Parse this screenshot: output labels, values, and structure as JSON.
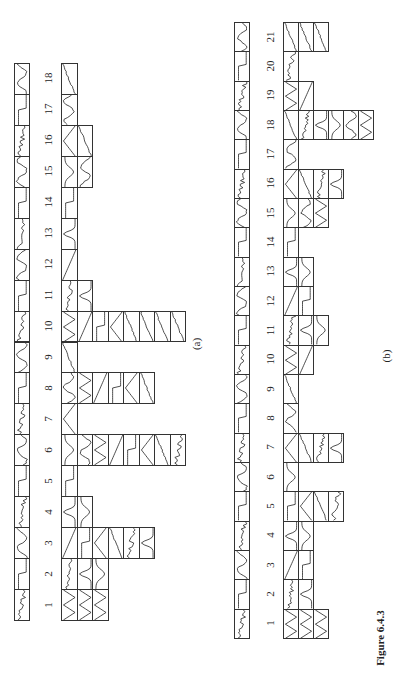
{
  "figure": {
    "caption": "Figure 6.4.3",
    "panel_a_label": "(a)",
    "panel_b_label": "(b)"
  },
  "panel_a": {
    "columns": [
      "1",
      "2",
      "3",
      "4",
      "5",
      "6",
      "7",
      "8",
      "9",
      "10",
      "11",
      "12",
      "13",
      "14",
      "15",
      "16",
      "17",
      "18"
    ],
    "stack_depths": [
      3,
      3,
      6,
      2,
      1,
      8,
      1,
      6,
      1,
      8,
      2,
      1,
      1,
      1,
      2,
      2,
      1,
      1
    ],
    "strip_x": 14,
    "strip_w": 16,
    "top_y": 63,
    "bottom_y": 620,
    "label_x": 48,
    "grid_x": 61,
    "cell_w": 15.5
  },
  "panel_b": {
    "columns": [
      "1",
      "2",
      "3",
      "4",
      "5",
      "6",
      "7",
      "8",
      "9",
      "10",
      "11",
      "12",
      "13",
      "14",
      "15",
      "16",
      "17",
      "18",
      "19",
      "20",
      "21"
    ],
    "stack_depths": [
      3,
      2,
      2,
      2,
      4,
      1,
      4,
      1,
      1,
      2,
      3,
      2,
      2,
      1,
      3,
      4,
      1,
      6,
      2,
      1,
      3
    ],
    "strip_x": 234,
    "strip_w": 16,
    "top_y": 22,
    "bottom_y": 638,
    "label_x": 270,
    "grid_x": 283,
    "cell_w": 15
  },
  "curve_glyphs": [
    "zigzag",
    "noisy",
    "ramp",
    "peak",
    "step",
    "valley",
    "tri",
    "wave",
    "saw"
  ]
}
